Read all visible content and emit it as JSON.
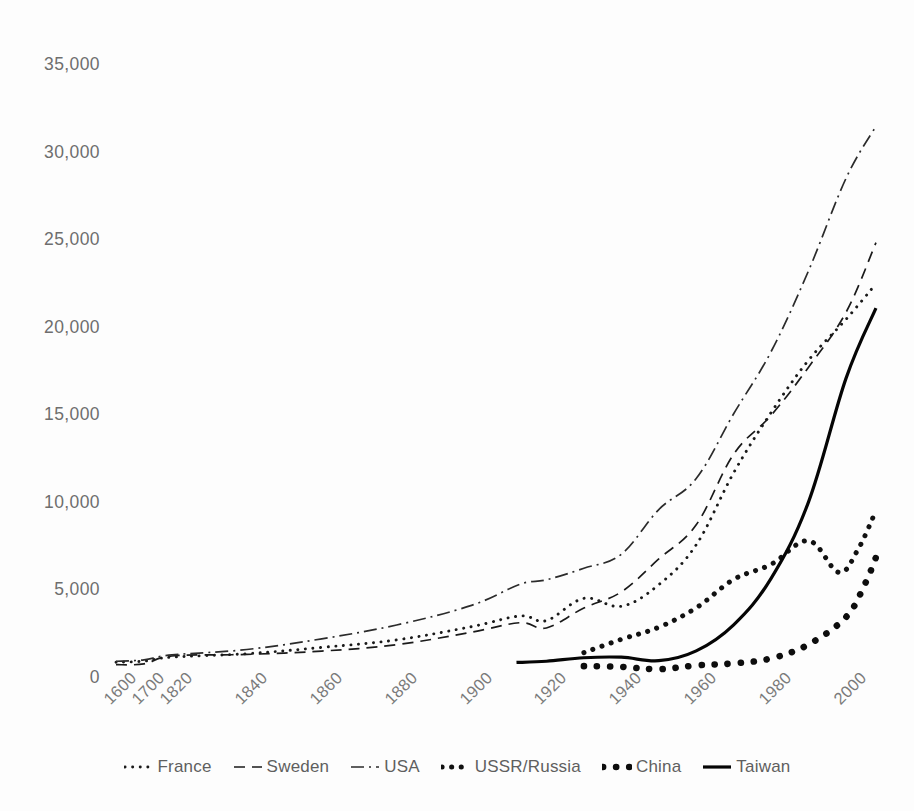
{
  "chart_data": {
    "type": "line",
    "title": "",
    "subtitle": "",
    "xlabel": "",
    "ylabel": "",
    "xlim": [
      1600,
      2010
    ],
    "ylim": [
      0,
      35000
    ],
    "grid": false,
    "legend_position": "bottom",
    "y_ticks": [
      0,
      5000,
      10000,
      15000,
      20000,
      25000,
      30000,
      35000
    ],
    "y_tick_labels": [
      "0",
      "5,000",
      "10,000",
      "15,000",
      "20,000",
      "25,000",
      "30,000",
      "35,000"
    ],
    "x_tick_labels": [
      "1600",
      "1700",
      "1820",
      "1840",
      "1860",
      "1880",
      "1900",
      "1920",
      "1940",
      "1960",
      "1980",
      "2000"
    ],
    "x_tick_values": [
      1600,
      1700,
      1820,
      1840,
      1860,
      1880,
      1900,
      1920,
      1940,
      1960,
      1980,
      2000
    ],
    "series": [
      {
        "name": "France",
        "style": "dotted",
        "color": "#1a1a1a",
        "x": [
          1600,
          1700,
          1820,
          1840,
          1860,
          1880,
          1900,
          1913,
          1920,
          1930,
          1940,
          1950,
          1960,
          1970,
          1980,
          1990,
          2000,
          2008
        ],
        "values": [
          840,
          910,
          1135,
          1330,
          1690,
          2120,
          2875,
          3485,
          3220,
          4490,
          4040,
          5270,
          7550,
          11660,
          15100,
          18090,
          20420,
          22450
        ]
      },
      {
        "name": "Sweden",
        "style": "dashed",
        "color": "#1a1a1a",
        "x": [
          1600,
          1700,
          1820,
          1840,
          1860,
          1880,
          1900,
          1913,
          1920,
          1930,
          1940,
          1950,
          1960,
          1970,
          1980,
          1990,
          2000,
          2008
        ],
        "values": [
          700,
          750,
          1200,
          1290,
          1480,
          1845,
          2560,
          3100,
          2800,
          3940,
          4860,
          6740,
          8690,
          12720,
          14940,
          17690,
          20820,
          24800
        ]
      },
      {
        "name": "USA",
        "style": "dashdot",
        "color": "#2b2b2b",
        "x": [
          1600,
          1700,
          1820,
          1840,
          1860,
          1880,
          1900,
          1913,
          1920,
          1930,
          1940,
          1950,
          1960,
          1970,
          1980,
          1990,
          2000,
          2008
        ],
        "values": [
          900,
          980,
          1260,
          1570,
          2180,
          2970,
          4090,
          5300,
          5550,
          6210,
          7010,
          9560,
          11330,
          15030,
          18580,
          23200,
          28470,
          31450
        ]
      },
      {
        "name": "USSR/Russia",
        "style": "dotted-thick",
        "color": "#111111",
        "x": [
          1930,
          1940,
          1950,
          1960,
          1970,
          1980,
          1990,
          1998,
          2003,
          2008
        ],
        "values": [
          1390,
          2150,
          2840,
          3950,
          5570,
          6430,
          7780,
          5980,
          7200,
          9500
        ]
      },
      {
        "name": "China",
        "style": "dotted-bold",
        "color": "#0d0d0d",
        "x": [
          1930,
          1940,
          1950,
          1960,
          1970,
          1980,
          1990,
          2000,
          2005,
          2008
        ],
        "values": [
          620,
          580,
          450,
          660,
          780,
          1060,
          1860,
          3420,
          5280,
          6830
        ]
      },
      {
        "name": "Taiwan",
        "style": "solid",
        "color": "#050505",
        "x": [
          1912,
          1920,
          1930,
          1940,
          1950,
          1960,
          1970,
          1980,
          1990,
          2000,
          2008
        ],
        "values": [
          830,
          900,
          1100,
          1130,
          930,
          1490,
          2980,
          5630,
          10000,
          17050,
          21060
        ]
      }
    ]
  },
  "legend": {
    "items": [
      {
        "label": "France",
        "marker": "dotted-line-marker"
      },
      {
        "label": "Sweden",
        "marker": "dashed-line-marker"
      },
      {
        "label": "USA",
        "marker": "dashdot-line-marker"
      },
      {
        "label": "USSR/Russia",
        "marker": "thick-dotted-line-marker"
      },
      {
        "label": "China",
        "marker": "bold-dots-marker"
      },
      {
        "label": "Taiwan",
        "marker": "solid-line-marker"
      }
    ]
  },
  "colors": {
    "axis_text": "#6e6e6e",
    "line": "#1a1a1a",
    "background": "#fdfdfd"
  }
}
